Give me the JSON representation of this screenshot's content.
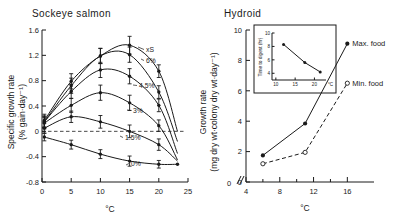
{
  "chart_data": [
    {
      "id": "sockeye",
      "type": "line",
      "title": "Sockeye salmon",
      "xlabel": "°C",
      "ylabel": "Specific growth rate\n(% gain·day⁻¹)",
      "ylabel_line1": "Specific growth rate",
      "ylabel_line2": "(% gain·day⁻¹)",
      "xlim": [
        0,
        25
      ],
      "ylim": [
        -0.8,
        1.6
      ],
      "xticks": [
        0,
        5,
        10,
        15,
        20,
        25
      ],
      "xticklabels": [
        "0",
        "5",
        "10",
        "15",
        "20",
        "25"
      ],
      "yticks": [
        1.6,
        1.2,
        0.8,
        0.4,
        0,
        -0.4,
        -0.8
      ],
      "yticklabels": [
        "1.6",
        "1.2",
        "0.8",
        "0.4",
        "0",
        "-0.4",
        "-0.8"
      ],
      "grid": false,
      "zero_reference_line": 0,
      "legend_position": "inline-curve-labels",
      "series": [
        {
          "name": "xS",
          "label": "xS",
          "marker": "filled-circle",
          "x": [
            0.4,
            5,
            10,
            15,
            20,
            23.2
          ],
          "y": [
            0.17,
            0.79,
            1.19,
            1.36,
            0.95,
            0.0
          ],
          "errors": [
            0.1,
            0.12,
            0.12,
            0.14,
            0.1,
            0.0
          ]
        },
        {
          "name": "6%",
          "label": "6%",
          "marker": "filled-circle",
          "x": [
            0.4,
            5,
            10,
            15,
            20,
            23.2
          ],
          "y": [
            0.15,
            0.72,
            1.19,
            1.21,
            0.62,
            -0.16
          ],
          "errors": [
            0.09,
            0.12,
            0.12,
            0.12,
            0.1,
            0.0
          ]
        },
        {
          "name": "4.5%",
          "label": "4.5%",
          "marker": "filled-circle",
          "x": [
            0.4,
            5,
            10,
            15,
            20,
            23.2
          ],
          "y": [
            0.15,
            0.63,
            0.97,
            0.87,
            0.41,
            -0.35
          ],
          "errors": [
            0.09,
            0.11,
            0.12,
            0.12,
            0.1,
            0.0
          ]
        },
        {
          "name": "3%",
          "label": "3%",
          "marker": "filled-circle",
          "x": [
            0.4,
            5,
            10,
            15,
            20,
            23.2
          ],
          "y": [
            0.13,
            0.41,
            0.61,
            0.45,
            0.09,
            -0.45
          ],
          "errors": [
            0.09,
            0.11,
            0.12,
            0.12,
            0.09,
            0.0
          ]
        },
        {
          "name": "1.5%",
          "label": "1.5%",
          "marker": "filled-circle",
          "x": [
            0.4,
            5,
            10,
            15,
            20,
            23.2
          ],
          "y": [
            0.05,
            0.23,
            0.15,
            0.0,
            -0.21,
            -0.47
          ],
          "errors": [
            0.08,
            0.09,
            0.1,
            0.1,
            0.09,
            0.0
          ]
        },
        {
          "name": "0%",
          "label": "0%",
          "marker": "filled-circle",
          "x": [
            0.4,
            5,
            10,
            15,
            20,
            23.2
          ],
          "y": [
            -0.09,
            -0.21,
            -0.36,
            -0.47,
            -0.52,
            -0.52
          ],
          "errors": [
            0.06,
            0.07,
            0.07,
            0.08,
            0.06,
            0.0
          ]
        }
      ]
    },
    {
      "id": "hydroid",
      "type": "line",
      "title": "Hydroid",
      "xlabel": "°C",
      "ylabel_line1": "Growth rate",
      "ylabel_line2": "(mg dry wt·colony dry wt·day⁻¹)",
      "xlim": [
        4,
        17.5
      ],
      "ylim": [
        0,
        10
      ],
      "xticks": [
        4,
        8,
        12,
        16
      ],
      "xticklabels": [
        "4",
        "8",
        "12",
        "16"
      ],
      "xminorticks": [
        6,
        10,
        14
      ],
      "yticks": [
        0,
        2,
        4,
        6,
        8,
        10
      ],
      "yticklabels": [
        "0",
        "2",
        "4",
        "6",
        "8",
        "10"
      ],
      "axis_break": true,
      "origin_label": "0",
      "grid": false,
      "legend_position": "right-of-points",
      "series": [
        {
          "name": "Max. food",
          "label": "Max. food",
          "marker": "filled-circle",
          "linestyle": "solid",
          "x": [
            6,
            11,
            16
          ],
          "y": [
            1.75,
            3.85,
            9.1
          ]
        },
        {
          "name": "Min. food",
          "label": "Min. food",
          "marker": "open-circle",
          "linestyle": "dashed",
          "x": [
            6,
            11,
            16
          ],
          "y": [
            1.2,
            1.95,
            6.5
          ]
        }
      ]
    },
    {
      "id": "hydroid-inset",
      "type": "line",
      "title": "",
      "xlabel": "°C",
      "ylabel": "Time to digest (hr)",
      "xlim": [
        9,
        23
      ],
      "ylim": [
        3,
        10
      ],
      "xticks": [
        10,
        15,
        20
      ],
      "xticklabels": [
        "10",
        "15",
        "20"
      ],
      "yticks": [
        4,
        6,
        8,
        10
      ],
      "yticklabels": [
        "4",
        "6",
        "8",
        "10"
      ],
      "grid": false,
      "series": [
        {
          "name": "time-to-digest",
          "marker": "filled-circle",
          "linestyle": "solid",
          "x": [
            12,
            17.5,
            21.5
          ],
          "y": [
            8.3,
            5.6,
            4.2
          ]
        }
      ]
    }
  ]
}
